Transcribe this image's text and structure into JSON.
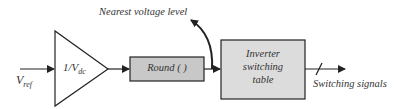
{
  "diagram": {
    "type": "block-diagram",
    "input": {
      "symbol": "V",
      "subscript": "ref"
    },
    "gain_block": {
      "numerator": "1/V",
      "subscript": "dc"
    },
    "round_block": {
      "label": "Round ( )"
    },
    "feedback_label": "Nearest voltage level",
    "table_block": {
      "lines": [
        "Inverter",
        "switching",
        "table"
      ]
    },
    "output_label": "Switching signals",
    "colors": {
      "stroke": "#222222",
      "round_fill": "#c8c8c8",
      "table_fill": "#dcdcdc",
      "text": "#333333"
    }
  }
}
